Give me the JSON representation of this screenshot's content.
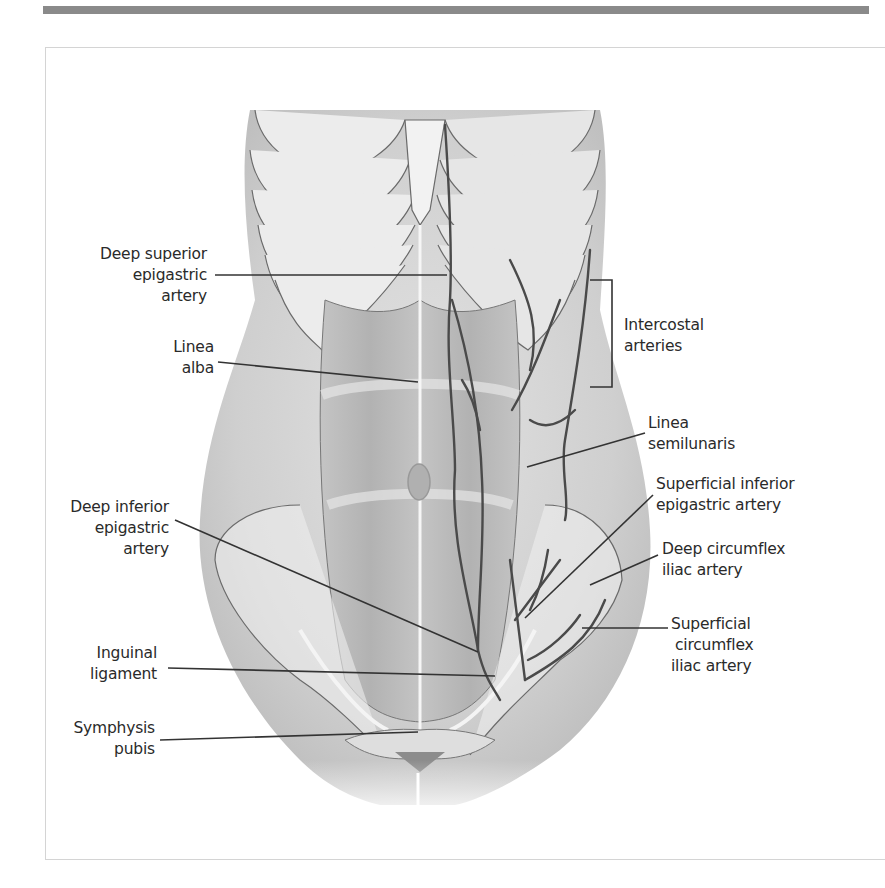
{
  "figure": {
    "type": "anatomical-illustration",
    "colors": {
      "top_bar": "#8a8a8a",
      "frame_border": "#d4d4d4",
      "label_text": "#2a2a2a",
      "leader_line": "#333333",
      "artery": "#4a4a4a",
      "skin_shadow": "#b9b9b9"
    }
  },
  "labels": {
    "left": [
      {
        "id": "deep-superior-epigastric-artery",
        "lines": [
          "Deep superior",
          "epigastric",
          "artery"
        ]
      },
      {
        "id": "linea-alba",
        "lines": [
          "Linea",
          "alba"
        ]
      },
      {
        "id": "deep-inferior-epigastric-artery",
        "lines": [
          "Deep inferior",
          "epigastric",
          "artery"
        ]
      },
      {
        "id": "inguinal-ligament",
        "lines": [
          "Inguinal",
          "ligament"
        ]
      },
      {
        "id": "symphysis-pubis",
        "lines": [
          "Symphysis",
          "pubis"
        ]
      }
    ],
    "right": [
      {
        "id": "intercostal-arteries",
        "lines": [
          "Intercostal",
          "arteries"
        ]
      },
      {
        "id": "linea-semilunaris",
        "lines": [
          "Linea",
          "semilunaris"
        ]
      },
      {
        "id": "superficial-inferior-epigastric-artery",
        "lines": [
          "Superficial inferior",
          "epigastric artery"
        ]
      },
      {
        "id": "deep-circumflex-iliac-artery",
        "lines": [
          "Deep circumflex",
          "iliac artery"
        ]
      },
      {
        "id": "superficial-circumflex-iliac-artery",
        "lines": [
          "Superficial",
          "circumflex",
          "iliac artery"
        ]
      }
    ]
  }
}
